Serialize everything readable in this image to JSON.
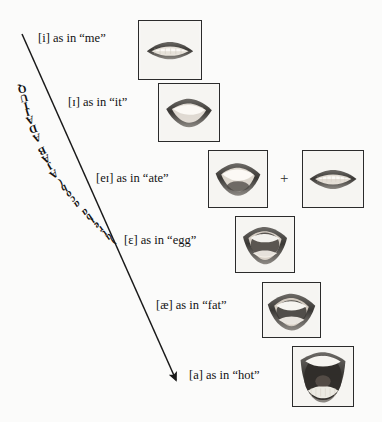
{
  "diagram": {
    "title_text": "QUIJADA BAJA (boca abierta)",
    "title_caps": "QUIJADA BAJA ",
    "title_italic": "(boca abierta)",
    "arrow": {
      "name": "jaw-lowering-arrow",
      "x1": 22,
      "y1": 34,
      "x2": 176,
      "y2": 380,
      "color": "#1a1a1a"
    },
    "background_color": "#fbfbfa",
    "text_color": "#121212",
    "border_color": "#2b2b2b",
    "plus_symbol": "+",
    "rows": [
      {
        "id": "row-i",
        "ipa": "[i]",
        "connector": "as in",
        "word": "“me”",
        "label_full": "[i] as in “me”",
        "label_x": 38,
        "label_y": 32,
        "photo": {
          "name": "mouth-photo-i",
          "x": 138,
          "y": 20,
          "w": 62,
          "h": 58,
          "mouth": "close-smile-spread"
        }
      },
      {
        "id": "row-small-cap-i",
        "ipa": "[ɪ]",
        "connector": "as in",
        "word": "“it”",
        "label_full": "[ɪ] as in “it”",
        "label_x": 68,
        "label_y": 96,
        "photo": {
          "name": "mouth-photo-small-cap-i",
          "x": 158,
          "y": 83,
          "w": 60,
          "h": 57,
          "mouth": "near-close"
        }
      },
      {
        "id": "row-ei",
        "ipa": "[eɪ]",
        "connector": "as in",
        "word": "“ate”",
        "label_full": "[eɪ] as in “ate”",
        "label_x": 96,
        "label_y": 172,
        "photo": {
          "name": "mouth-photo-ei-first",
          "x": 208,
          "y": 150,
          "w": 58,
          "h": 56,
          "mouth": "mid-open"
        },
        "photo2": {
          "name": "mouth-photo-ei-second",
          "x": 302,
          "y": 150,
          "w": 60,
          "h": 56,
          "mouth": "close-spread"
        },
        "has_plus": true,
        "plus_x": 280,
        "plus_y": 171
      },
      {
        "id": "row-epsilon",
        "ipa": "[ɛ]",
        "connector": "as in",
        "word": "“egg”",
        "label_full": "[ɛ] as in “egg”",
        "label_x": 124,
        "label_y": 234,
        "photo": {
          "name": "mouth-photo-epsilon",
          "x": 235,
          "y": 216,
          "w": 58,
          "h": 55,
          "mouth": "open-mid"
        }
      },
      {
        "id": "row-ash",
        "ipa": "[æ]",
        "connector": "as in",
        "word": "“fat”",
        "label_full": "[æ] as in “fat”",
        "label_x": 156,
        "label_y": 299,
        "photo": {
          "name": "mouth-photo-ash",
          "x": 262,
          "y": 282,
          "w": 57,
          "h": 54,
          "mouth": "open-wide-smile"
        }
      },
      {
        "id": "row-a",
        "ipa": "[a]",
        "connector": "as in",
        "word": "“hot”",
        "label_full": "[a] as in “hot”",
        "label_x": 189,
        "label_y": 369,
        "photo": {
          "name": "mouth-photo-a",
          "x": 292,
          "y": 346,
          "w": 60,
          "h": 59,
          "mouth": "fully-open"
        }
      }
    ]
  }
}
